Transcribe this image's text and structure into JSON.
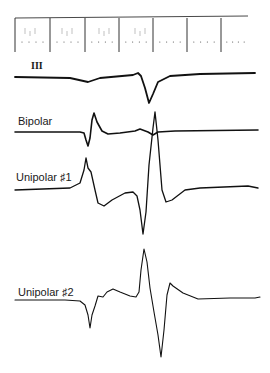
{
  "chart_data": {
    "type": "line",
    "title": "",
    "xlabel": "",
    "ylabel": "",
    "grid": false,
    "legend": "inline labels left of each trace",
    "timing_bar": {
      "description": "time marker bar with 7 vertical division ticks and dotted sub-markers",
      "ticks_x": [
        15,
        50,
        85,
        119,
        153,
        187,
        221
      ]
    },
    "series": [
      {
        "name": "III",
        "label_style": "roman numeral",
        "description": "surface ECG lead III: flat baseline with small shallow dip, then single negative deflection",
        "points": [
          [
            15,
            77
          ],
          [
            70,
            78
          ],
          [
            88,
            82
          ],
          [
            100,
            78
          ],
          [
            133,
            75
          ],
          [
            138,
            73
          ],
          [
            141,
            76
          ],
          [
            145,
            88
          ],
          [
            149,
            103
          ],
          [
            153,
            94
          ],
          [
            158,
            82
          ],
          [
            170,
            76
          ],
          [
            200,
            74
          ],
          [
            255,
            73
          ]
        ]
      },
      {
        "name": "Bipolar",
        "description": "bipolar electrogram: early biphasic spike (dip then peak), later small crossing deflection",
        "points": [
          [
            15,
            132
          ],
          [
            80,
            132
          ],
          [
            84,
            133
          ],
          [
            86,
            140
          ],
          [
            88,
            146
          ],
          [
            90,
            138
          ],
          [
            92,
            120
          ],
          [
            94,
            113
          ],
          [
            97,
            122
          ],
          [
            102,
            131
          ],
          [
            108,
            134
          ],
          [
            120,
            133
          ],
          [
            135,
            131
          ],
          [
            140,
            129
          ],
          [
            148,
            132
          ],
          [
            153,
            135
          ],
          [
            158,
            132
          ],
          [
            175,
            131
          ],
          [
            258,
            130
          ]
        ]
      },
      {
        "name": "Unipolar #1",
        "description": "unipolar electrogram 1: early sharp peak, negative plateau, deep negative spike then tall positive spike crossing bipolar trace",
        "points": [
          [
            15,
            190
          ],
          [
            70,
            188
          ],
          [
            80,
            183
          ],
          [
            84,
            170
          ],
          [
            86,
            158
          ],
          [
            88,
            168
          ],
          [
            91,
            172
          ],
          [
            95,
            190
          ],
          [
            98,
            203
          ],
          [
            104,
            206
          ],
          [
            112,
            200
          ],
          [
            125,
            193
          ],
          [
            133,
            192
          ],
          [
            137,
            196
          ],
          [
            140,
            210
          ],
          [
            143,
            234
          ],
          [
            146,
            212
          ],
          [
            149,
            165
          ],
          [
            153,
            128
          ],
          [
            155,
            112
          ],
          [
            158,
            140
          ],
          [
            162,
            190
          ],
          [
            166,
            202
          ],
          [
            172,
            200
          ],
          [
            185,
            190
          ],
          [
            200,
            188
          ],
          [
            248,
            186
          ],
          [
            258,
            188
          ]
        ]
      },
      {
        "name": "Unipolar #2",
        "description": "unipolar electrogram 2: small negative dip, small hump, tall positive spike, deep negative spike, return to baseline",
        "points": [
          [
            15,
            300
          ],
          [
            65,
            300
          ],
          [
            80,
            301
          ],
          [
            85,
            305
          ],
          [
            88,
            315
          ],
          [
            90,
            328
          ],
          [
            92,
            315
          ],
          [
            95,
            306
          ],
          [
            98,
            296
          ],
          [
            103,
            297
          ],
          [
            107,
            292
          ],
          [
            113,
            289
          ],
          [
            120,
            292
          ],
          [
            130,
            296
          ],
          [
            136,
            297
          ],
          [
            139,
            292
          ],
          [
            141,
            270
          ],
          [
            144,
            249
          ],
          [
            147,
            262
          ],
          [
            150,
            288
          ],
          [
            154,
            312
          ],
          [
            158,
            335
          ],
          [
            161,
            357
          ],
          [
            164,
            330
          ],
          [
            167,
            295
          ],
          [
            170,
            283
          ],
          [
            173,
            286
          ],
          [
            183,
            293
          ],
          [
            198,
            299
          ],
          [
            230,
            298
          ],
          [
            255,
            298
          ],
          [
            260,
            297
          ]
        ]
      }
    ]
  },
  "labels": {
    "lead_iii": "III",
    "bipolar": "Bipolar",
    "unipolar_1": "Unipolar ♯1",
    "unipolar_2": "Unipolar ♯2"
  }
}
